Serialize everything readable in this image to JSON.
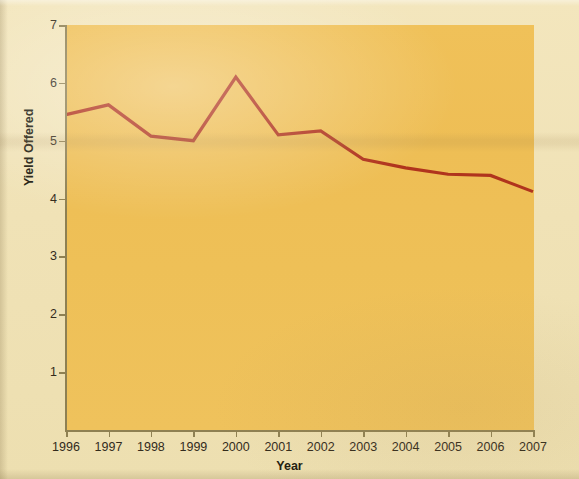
{
  "chart_data": {
    "type": "line",
    "title": "",
    "xlabel": "Year",
    "ylabel": "Yield Offered",
    "categories": [
      "1996",
      "1997",
      "1998",
      "1999",
      "2000",
      "2001",
      "2002",
      "2003",
      "2004",
      "2005",
      "2006",
      "2007"
    ],
    "x": [
      1996,
      1997,
      1998,
      1999,
      2000,
      2001,
      2002,
      2003,
      2004,
      2005,
      2006,
      2007
    ],
    "values": [
      5.45,
      5.62,
      5.08,
      5.0,
      6.1,
      5.1,
      5.17,
      4.68,
      4.53,
      4.42,
      4.4,
      4.12
    ],
    "series": [
      {
        "name": "Yield Offered",
        "color": "#b0341d",
        "values": [
          5.45,
          5.62,
          5.08,
          5.0,
          6.1,
          5.1,
          5.17,
          4.68,
          4.53,
          4.42,
          4.4,
          4.12
        ]
      }
    ],
    "ylim": [
      0,
      7
    ],
    "xlim": [
      1995.5,
      2007.5
    ],
    "yticks": [
      1,
      2,
      3,
      4,
      5,
      6,
      7
    ],
    "ytick_labels": [
      "1",
      "2",
      "3",
      "4",
      "5",
      "6",
      "7"
    ],
    "xticks": [
      1996,
      1997,
      1998,
      1999,
      2000,
      2001,
      2002,
      2003,
      2004,
      2005,
      2006,
      2007
    ],
    "xtick_labels": [
      "1996",
      "1997",
      "1998",
      "1999",
      "2000",
      "2001",
      "2002",
      "2003",
      "2004",
      "2005",
      "2006",
      "2007"
    ],
    "grid": false,
    "legend": false,
    "legend_position": "none",
    "line_color": "#b0341d",
    "line_width": 3,
    "plot_background": "#eec057",
    "figure_background": "#f0e2b6",
    "axis_color": "#8e8052"
  },
  "figure": {
    "plot_bg_color": "#eec057",
    "page_bg_color": "#f0e2b6",
    "line_color": "#b0341d",
    "axis_color": "#8e8052",
    "text_color": "#221c10"
  },
  "ghost_text": {
    "line_1": "Yield offered on bonds",
    "line_2": "Years to Maturity",
    "line_3": "Years to Maturity in Years",
    "line_4": "Corporate Bonds",
    "line_5": "10",
    "line_6": "15",
    "line_7": "20"
  }
}
